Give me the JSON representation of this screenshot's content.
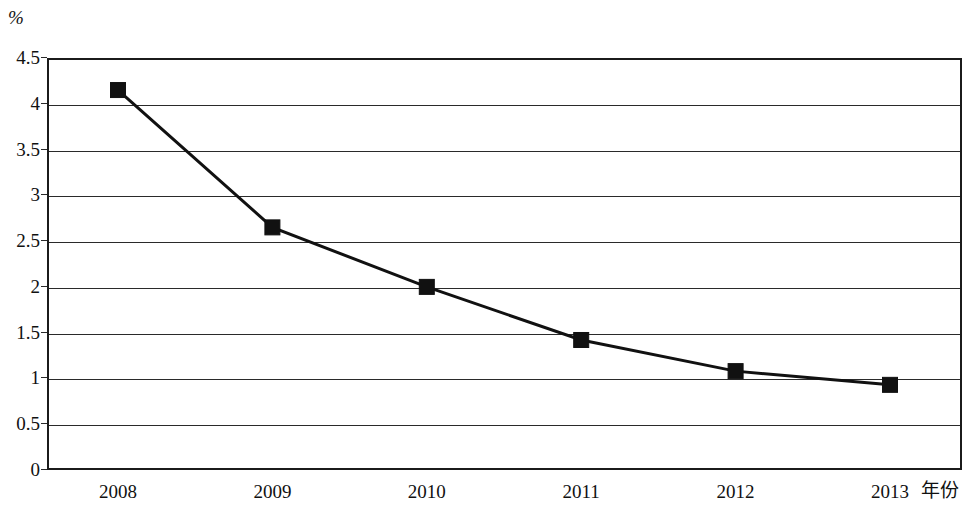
{
  "chart_data": {
    "type": "line",
    "title": "",
    "subtitle": "",
    "xlabel": "年份",
    "ylabel": "%",
    "categories": [
      "2008",
      "2009",
      "2010",
      "2011",
      "2012",
      "2013"
    ],
    "x": [
      2008,
      2009,
      2010,
      2011,
      2012,
      2013
    ],
    "values": [
      4.15,
      2.65,
      2.0,
      1.42,
      1.08,
      0.93
    ],
    "series": [
      {
        "name": "",
        "values": [
          4.15,
          2.65,
          2.0,
          1.42,
          1.08,
          0.93
        ]
      }
    ],
    "ylim": [
      0,
      4.5
    ],
    "ytick_labels": [
      "0",
      "0.5",
      "1",
      "1.5",
      "2",
      "2.5",
      "3",
      "3.5",
      "4",
      "4.5"
    ],
    "ytick_values": [
      0,
      0.5,
      1,
      1.5,
      2,
      2.5,
      3,
      3.5,
      4,
      4.5
    ],
    "xtick_labels": [
      "2008",
      "2009",
      "2010",
      "2011",
      "2012",
      "2013"
    ],
    "grid": "horizontal",
    "legend": "none",
    "marker": "filled-square",
    "colors": {
      "line": "#111111",
      "marker": "#111111",
      "grid": "#2a2a2a",
      "frame": "#1b1b1b",
      "background": "#ffffff"
    },
    "annotations": []
  },
  "axis": {
    "unit_label": "%",
    "x_axis_title": "年份"
  }
}
